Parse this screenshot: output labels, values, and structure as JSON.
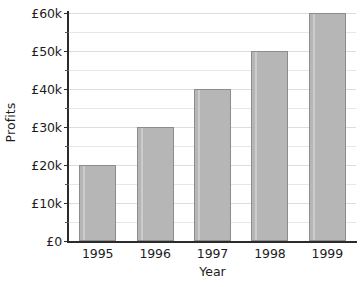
{
  "chart_data": {
    "type": "bar",
    "title": "",
    "subtitle": "",
    "xlabel": "Year",
    "ylabel": "Profits",
    "categories": [
      "1995",
      "1996",
      "1997",
      "1998",
      "1999"
    ],
    "values": [
      20000,
      30000,
      40000,
      50000,
      60000
    ],
    "series": [
      {
        "name": "Profits",
        "values": [
          20000,
          30000,
          40000,
          50000,
          60000
        ]
      }
    ],
    "ylim": [
      0,
      60000
    ],
    "ytick_values": [
      0,
      10000,
      20000,
      30000,
      40000,
      50000,
      60000
    ],
    "ytick_labels": [
      "£0",
      "£10k",
      "£20k",
      "£30k",
      "£40k",
      "£50k",
      "£60k"
    ],
    "minor_ytick_values": [
      5000,
      15000,
      25000,
      35000,
      45000,
      55000
    ],
    "xtick_labels": [
      "1995",
      "1996",
      "1997",
      "1998",
      "1999"
    ],
    "grid": true,
    "grid_axis": "y",
    "legend": false,
    "legend_position": "none",
    "annotations": [],
    "currency_symbol": "£",
    "value_labels": [
      "£20k",
      "£30k",
      "£40k",
      "£50k",
      "£60k"
    ],
    "colors": {
      "bar_fill": "#b6b6b6",
      "bar_border": "#8c8c8c",
      "gridline": "#e6e6e6",
      "axis": "#2b2b2b",
      "text": "#1c1c1c",
      "background": "#ffffff"
    }
  }
}
